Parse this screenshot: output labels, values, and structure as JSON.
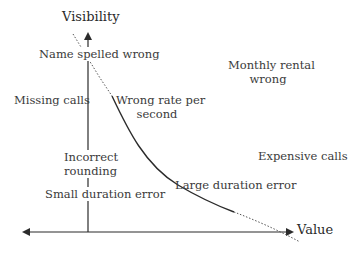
{
  "diagram": {
    "axes": {
      "y_label": "Visibility",
      "x_label": "Value"
    },
    "labels": {
      "name_spelled_wrong": "Name spelled wrong",
      "monthly_rental_line1": "Monthly rental",
      "monthly_rental_line2": "wrong",
      "missing_calls": "Missing calls",
      "wrong_rate_line1": "Wrong rate per",
      "wrong_rate_line2": "second",
      "incorrect_rounding_line1": "Incorrect",
      "incorrect_rounding_line2": "rounding",
      "expensive_calls": "Expensive calls",
      "large_duration_error": "Large duration error",
      "small_duration_error": "Small duration error"
    },
    "colors": {
      "line": "#2b2b2b",
      "dotted": "#555555",
      "text": "#3a3a3a",
      "background": "#ffffff"
    }
  }
}
